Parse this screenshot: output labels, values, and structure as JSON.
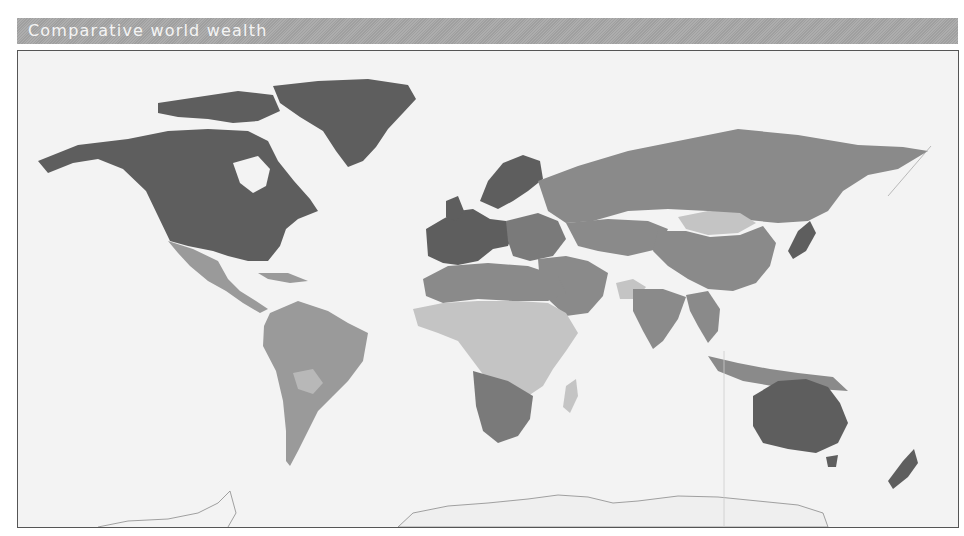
{
  "title": "Comparative world wealth",
  "map": {
    "projection": "world",
    "colors": {
      "ocean": "#f3f3f3",
      "very_high": "#5e5e5e",
      "high": "#7a7a7a",
      "medium": "#9a9a9a",
      "low": "#c4c4c4",
      "antarctica_outline": "#8a8a8a"
    },
    "regions": [
      {
        "name": "North America (USA, Canada)",
        "class": "very_high"
      },
      {
        "name": "Greenland",
        "class": "very_high"
      },
      {
        "name": "Western Europe",
        "class": "very_high"
      },
      {
        "name": "Scandinavia",
        "class": "very_high"
      },
      {
        "name": "Australia",
        "class": "very_high"
      },
      {
        "name": "New Zealand",
        "class": "very_high"
      },
      {
        "name": "Japan",
        "class": "very_high"
      },
      {
        "name": "Russia",
        "class": "medium"
      },
      {
        "name": "China",
        "class": "medium"
      },
      {
        "name": "Middle East",
        "class": "medium"
      },
      {
        "name": "Latin America",
        "class": "medium"
      },
      {
        "name": "North Africa",
        "class": "medium"
      },
      {
        "name": "Southern Africa",
        "class": "high"
      },
      {
        "name": "South & Southeast Asia",
        "class": "medium"
      },
      {
        "name": "Mongolia",
        "class": "low"
      },
      {
        "name": "Sub-Saharan Africa",
        "class": "low"
      },
      {
        "name": "Afghanistan",
        "class": "low"
      },
      {
        "name": "Antarctica",
        "class": "outline"
      }
    ]
  }
}
